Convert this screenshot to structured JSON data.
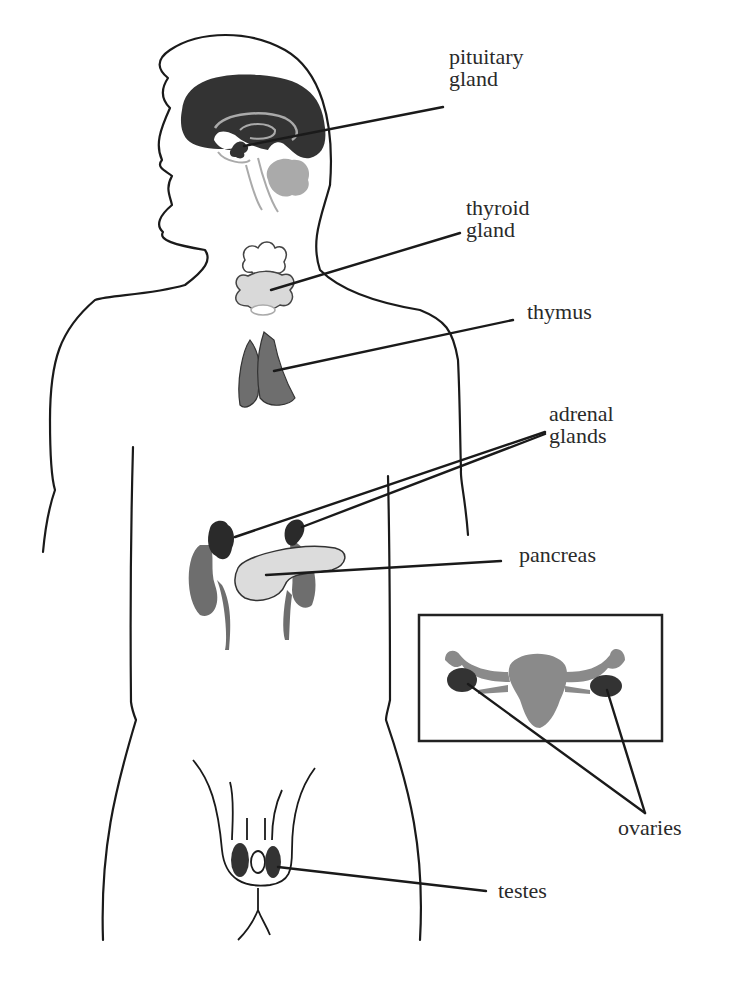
{
  "diagram": {
    "colors": {
      "outline": "#1a1a1a",
      "dark_organ": "#333333",
      "medium_organ": "#777777",
      "light_organ": "#cfcfcf",
      "faint_line": "#aaaaaa",
      "background": "#ffffff"
    },
    "labels": {
      "pituitary": {
        "line1": "pituitary",
        "line2": "gland"
      },
      "thyroid": {
        "line1": "thyroid",
        "line2": "gland"
      },
      "thymus": {
        "line1": "thymus"
      },
      "adrenal": {
        "line1": "adrenal",
        "line2": "glands"
      },
      "pancreas": {
        "line1": "pancreas"
      },
      "ovaries": {
        "line1": "ovaries"
      },
      "testes": {
        "line1": "testes"
      }
    },
    "inset": {
      "subject": "female reproductive organs (uterus, fallopian tubes, ovaries)"
    }
  }
}
